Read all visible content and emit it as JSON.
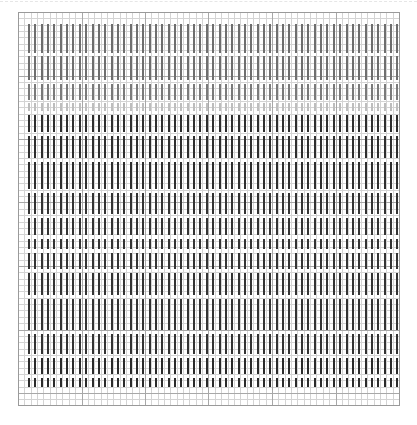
{
  "canvas": {
    "width": 417,
    "height": 425,
    "background": "#ffffff"
  },
  "grid": {
    "x0": 18,
    "y0": 12,
    "x1": 399,
    "y1": 405,
    "minor_cell": 6.35,
    "major_every": 10,
    "minor_color": "#d4d4d4",
    "major_color": "#a8a8a8",
    "border_color": "#9a9a9a"
  },
  "bars": {
    "count": 59,
    "first_x": 28,
    "spacing": 6.35,
    "width": 2,
    "segments": [
      {
        "y_start": 24,
        "y_end": 53,
        "color": "#6e6e6e"
      },
      {
        "y_start": 56,
        "y_end": 80,
        "color": "#6e6e6e"
      },
      {
        "y_start": 84,
        "y_end": 100,
        "color": "#7a7a7a"
      },
      {
        "y_start": 103,
        "y_end": 111,
        "color": "#bdbdbd"
      },
      {
        "y_start": 115,
        "y_end": 132,
        "color": "#2e2e2e"
      },
      {
        "y_start": 136,
        "y_end": 158,
        "color": "#2e2e2e"
      },
      {
        "y_start": 162,
        "y_end": 189,
        "color": "#2e2e2e"
      },
      {
        "y_start": 193,
        "y_end": 214,
        "color": "#333333"
      },
      {
        "y_start": 218,
        "y_end": 235,
        "color": "#333333"
      },
      {
        "y_start": 239,
        "y_end": 249,
        "color": "#333333"
      },
      {
        "y_start": 253,
        "y_end": 269,
        "color": "#333333"
      },
      {
        "y_start": 273,
        "y_end": 295,
        "color": "#333333"
      },
      {
        "y_start": 299,
        "y_end": 330,
        "color": "#333333"
      },
      {
        "y_start": 334,
        "y_end": 354,
        "color": "#333333"
      },
      {
        "y_start": 358,
        "y_end": 374,
        "color": "#2a2a2a"
      },
      {
        "y_start": 378,
        "y_end": 387,
        "color": "#2a2a2a"
      }
    ]
  }
}
